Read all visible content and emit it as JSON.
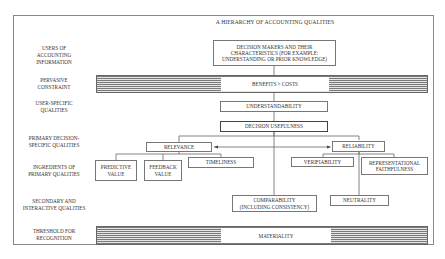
{
  "title": "A HIERARCHY OF ACCOUNTING QUALITIES",
  "row_labels": {
    "users": "USERS OF ACCOUNTING INFORMATION",
    "users_lines": [
      "USERS OF",
      "ACCOUNTING",
      "INFORMATION"
    ],
    "pervasive": [
      "PERVASIVE",
      "CONSTRAINT"
    ],
    "user_specific": [
      "USER-SPECIFIC",
      "QUALITIES"
    ],
    "primary": [
      "PRIMARY DECISION-",
      "SPECIFIC QUALITIES"
    ],
    "ingredients": [
      "INGREDIENTS OF",
      "PRIMARY QUALITIES"
    ],
    "secondary": [
      "SECONDARY AND",
      "INTERACTIVE QUALITIES"
    ],
    "threshold": [
      "THRESHOLD FOR",
      "RECOGNITION"
    ]
  },
  "nodes": {
    "decision_makers": [
      "DECISION MAKERS AND THEIR",
      "CHARACTERISTICS (FOR EXAMPLE:",
      "UNDERSTANDING OR PRIOR KNOWLEDGE)"
    ],
    "benefits_costs": "BENEFITS > COSTS",
    "understandability": "UNDERSTANDABILITY",
    "decision_usefulness": "DECISION USEFULNESS",
    "relevance": "RELEVANCE",
    "reliability": "RELIABILITY",
    "predictive_value": [
      "PREDICTIVE",
      "VALUE"
    ],
    "feedback_value": [
      "FEEDBACK",
      "VALUE"
    ],
    "timeliness": "TIMELINESS",
    "verifiability": "VERIFIABILITY",
    "representational_faithfulness": [
      "REPRESENTATIONAL",
      "FAITHFULNESS"
    ],
    "comparability": [
      "COMPARABILITY",
      "(INCLUDING CONSISTENCY)"
    ],
    "neutrality": "NEUTRALITY",
    "materiality": "MATERIALITY"
  },
  "colors": {
    "line": "#666666",
    "band_stripe": "#7a7a7a",
    "background": "#ffffff"
  }
}
